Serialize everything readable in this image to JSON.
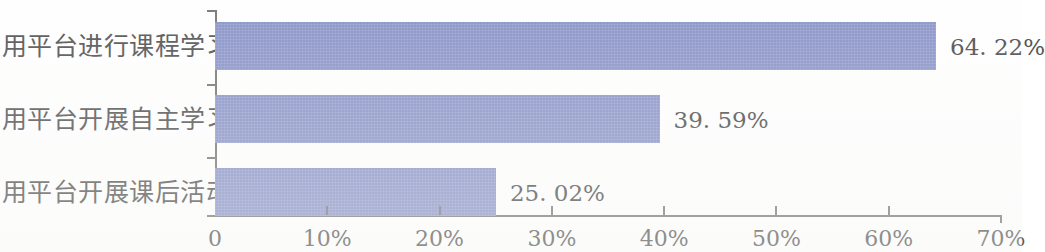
{
  "chart_data": {
    "type": "bar",
    "orientation": "horizontal",
    "title": "",
    "subtitle": "",
    "xlabel": "",
    "ylabel": "",
    "categories": [
      "利用平台进行课程学习",
      "利用平台开展自主学习",
      "利用平台开展课后活动"
    ],
    "values": [
      64.22,
      39.59,
      25.02
    ],
    "value_labels": [
      "64. 22%",
      "39. 59%",
      "25. 02%"
    ],
    "xlim": [
      0,
      70
    ],
    "xticks": [
      0,
      10,
      20,
      30,
      40,
      50,
      60,
      70
    ],
    "xtick_labels": [
      "0",
      "10%",
      "20%",
      "30%",
      "40%",
      "50%",
      "60%",
      "70%"
    ],
    "grid": false,
    "legend": null,
    "series": [
      {
        "name": "",
        "values": [
          64.22,
          39.59,
          25.02
        ]
      }
    ]
  },
  "style": {
    "bar_color": "#8d97c9",
    "axis_color": "#7d7d7d",
    "text_color": "#5b5b5b",
    "background": "#ffffff"
  }
}
